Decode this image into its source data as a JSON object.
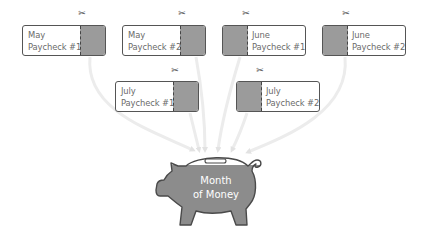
{
  "diagram": {
    "title": "Month of Money",
    "colors": {
      "card_border": "#555555",
      "stub_fill": "#9b9b9b",
      "arrow": "#e6e6e6",
      "pig_fill": "#8c8c8c",
      "pig_outline": "#4a4a4a",
      "text": "#6a6a6a"
    },
    "paychecks": [
      {
        "month": "May",
        "label": "Paycheck #1",
        "stub_side": "right",
        "icon": "scissors-icon"
      },
      {
        "month": "May",
        "label": "Paycheck #2",
        "stub_side": "right",
        "icon": "scissors-icon"
      },
      {
        "month": "June",
        "label": "Paycheck #1",
        "stub_side": "left",
        "icon": "scissors-icon"
      },
      {
        "month": "June",
        "label": "Paycheck #2",
        "stub_side": "left",
        "icon": "scissors-icon"
      },
      {
        "month": "July",
        "label": "Paycheck #1",
        "stub_side": "right",
        "icon": "scissors-icon"
      },
      {
        "month": "July",
        "label": "Paycheck #2",
        "stub_side": "left",
        "icon": "scissors-icon"
      }
    ],
    "scissors_glyph": "✂",
    "piggy_bank": {
      "icon": "piggy-bank-icon",
      "line1": "Month",
      "line2": "of Money"
    }
  }
}
